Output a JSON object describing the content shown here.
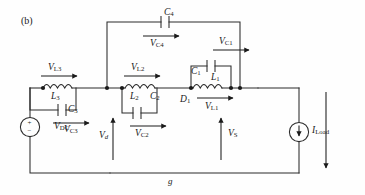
{
  "figure": {
    "panel_label": "(b)",
    "kind": "electrical-circuit-schematic"
  },
  "components": {
    "vdc": {
      "name": "V",
      "sub": "DC",
      "type": "dc-voltage-source",
      "polarity_top": "+",
      "polarity_bottom": "−"
    },
    "l3": {
      "name": "L",
      "sub": "3",
      "type": "inductor"
    },
    "c3": {
      "name": "C",
      "sub": "3",
      "type": "capacitor"
    },
    "l2": {
      "name": "L",
      "sub": "2",
      "type": "inductor"
    },
    "c2": {
      "name": "C",
      "sub": "2",
      "type": "capacitor"
    },
    "c4": {
      "name": "C",
      "sub": "4",
      "type": "capacitor"
    },
    "c1": {
      "name": "C",
      "sub": "1",
      "type": "capacitor"
    },
    "l1": {
      "name": "L",
      "sub": "1",
      "type": "inductor"
    },
    "d1": {
      "name": "D",
      "sub": "1",
      "type": "diode"
    },
    "iload": {
      "name": "I",
      "sub": "Load",
      "type": "current-source"
    }
  },
  "voltage_labels": {
    "vl3": {
      "name": "V",
      "sub": "L3",
      "arrow": "right"
    },
    "vl2": {
      "name": "V",
      "sub": "L2",
      "arrow": "right"
    },
    "vl1": {
      "name": "V",
      "sub": "L1",
      "arrow": "right"
    },
    "vc3": {
      "name": "V",
      "sub": "C3",
      "arrow": "right"
    },
    "vc2": {
      "name": "V",
      "sub": "C2",
      "arrow": "right"
    },
    "vc4": {
      "name": "V",
      "sub": "C4",
      "arrow": "right"
    },
    "vc1": {
      "name": "V",
      "sub": "C1",
      "arrow": "right"
    },
    "vd": {
      "name": "V",
      "sub": "d",
      "arrow": "up"
    },
    "vs": {
      "name": "V",
      "sub": "S",
      "arrow": "up"
    }
  },
  "ground": {
    "label": "g"
  },
  "colors": {
    "background": "#fefefe",
    "wire": "#2a2a2a",
    "text": "#1a1a1a",
    "node": "#1a1a1a"
  }
}
